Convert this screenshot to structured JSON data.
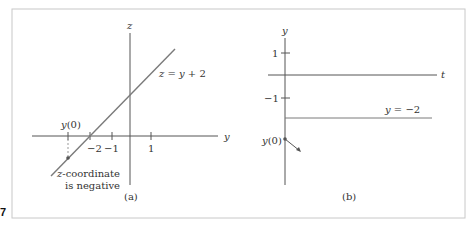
{
  "figure": {
    "number": "7",
    "frame_color": "#c8c8c8"
  },
  "panel_a": {
    "caption": "(a)",
    "axis_h_label": "y",
    "axis_v_label": "z",
    "ticks": [
      {
        "value": -2,
        "label": "−2"
      },
      {
        "value": -1,
        "label": "−1"
      },
      {
        "value": 1,
        "label": "1"
      }
    ],
    "marker_label": "y(0)",
    "line_label": "z = y + 2",
    "annotation_line1": "z-coordinate",
    "annotation_line2": "is negative",
    "line_color": "#7a7a7a",
    "axis_color": "#555555"
  },
  "panel_b": {
    "caption": "(b)",
    "axis_h_label": "t",
    "axis_v_label": "y",
    "ticks": [
      {
        "value": 1,
        "label": "1"
      },
      {
        "value": -1,
        "label": "−1"
      }
    ],
    "equilibrium_label": "y = −2",
    "marker_label": "y(0)",
    "line_color": "#7a7a7a",
    "axis_color": "#555555"
  }
}
